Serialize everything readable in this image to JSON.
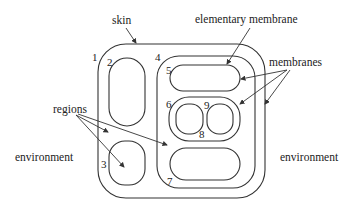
{
  "diagram": {
    "labels": {
      "skin": "skin",
      "elementary_membrane": "elementary membrane",
      "membranes": "membranes",
      "regions": "regions",
      "environment_left": "environment",
      "environment_right": "environment"
    },
    "membrane_numbers": [
      "1",
      "2",
      "3",
      "4",
      "5",
      "6",
      "7",
      "8",
      "9"
    ],
    "colors": {
      "stroke": "#333333",
      "text": "#222222",
      "background": "#ffffff"
    }
  }
}
